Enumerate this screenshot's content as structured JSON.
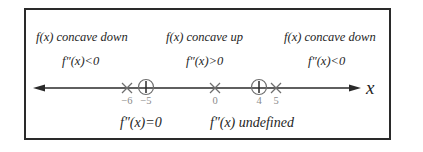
{
  "diagram": {
    "regions": [
      {
        "concavity_label": "f(x) concave down",
        "sign_label": "f″(x)<0"
      },
      {
        "concavity_label": "f(x) concave up",
        "sign_label": "f″(x)>0"
      },
      {
        "concavity_label": "f(x) concave down",
        "sign_label": "f″(x)<0"
      }
    ],
    "axis_label": "x",
    "points": [
      {
        "value": -6,
        "label": "−6",
        "marker": "cross",
        "meaning": "f''(x) undefined"
      },
      {
        "value": -5,
        "label": "−5",
        "marker": "circle-plus",
        "meaning": "f''(x)=0"
      },
      {
        "value": 0,
        "label": "0",
        "marker": "cross",
        "meaning": "f''(x) undefined"
      },
      {
        "value": 4,
        "label": "4",
        "marker": "circle-plus",
        "meaning": "f''(x)=0"
      },
      {
        "value": 5,
        "label": "5",
        "marker": "cross",
        "meaning": "f''(x) undefined"
      }
    ],
    "legend": {
      "zero_label": "f″(x)=0",
      "undefined_label": "f″(x) undefined"
    },
    "colors": {
      "line": "#2a2a2a",
      "tick_label": "#8a8a8a",
      "marker": "#6e6e6e"
    }
  }
}
